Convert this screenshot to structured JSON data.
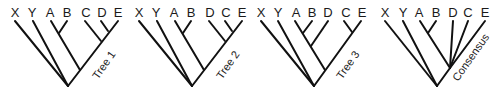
{
  "figure": {
    "trees": [
      {
        "name": "Tree 1",
        "leaves": [
          "X",
          "Y",
          "A",
          "B",
          "C",
          "D",
          "E"
        ],
        "topology": "(X,Y,((A,B),(C,(D,E))))"
      },
      {
        "name": "Tree 2",
        "leaves": [
          "X",
          "Y",
          "A",
          "B",
          "D",
          "C",
          "E"
        ],
        "topology": "(X,Y,((A,B),(D,(C,E))))"
      },
      {
        "name": "Tree 3",
        "leaves": [
          "X",
          "Y",
          "A",
          "B",
          "D",
          "C",
          "E"
        ],
        "topology": "(X,Y,(((A,B),D),(C,E)))"
      },
      {
        "name": "Consensus",
        "leaves": [
          "X",
          "Y",
          "A",
          "B",
          "D",
          "C",
          "E"
        ],
        "topology": "(X,Y,((A,B),D,C,E))"
      }
    ]
  }
}
